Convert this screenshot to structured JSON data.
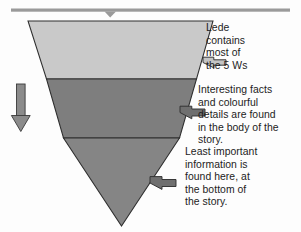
{
  "diagram": {
    "colors": {
      "top_band": "#c9c9c9",
      "middle_band": "#7e7e7e",
      "bottom_band": "#858585",
      "outline": "#2e2e2e",
      "rule": "#9a9a9a",
      "arrow_fill_light": "#c4c4c4",
      "arrow_fill_dark": "#6f6f6f",
      "arrow_outline": "#303030",
      "text": "#1c1c1c",
      "background": "#fdfdfd"
    },
    "top_rule": {
      "name": "top-horizontal-rule",
      "marker": "down-chevron"
    },
    "flow_arrow": {
      "name": "downward-flow-arrow",
      "direction": "down"
    },
    "bands": [
      {
        "id": "lede",
        "label": "Lede",
        "shade": "light"
      },
      {
        "id": "body",
        "label": "Body",
        "shade": "medium"
      },
      {
        "id": "tail",
        "label": "Tail",
        "shade": "medium-dark"
      }
    ],
    "callouts": [
      {
        "id": "lede",
        "text": "Lede\ncontains\nmost of\nthe 5 Ws",
        "arrow": "left-arrow-lede"
      },
      {
        "id": "body",
        "text": "Interesting facts\nand colourful\ndetails are found\nin the body of the\nstory.",
        "arrow": "left-arrow-body"
      },
      {
        "id": "tail",
        "text": "Least important\ninformation is\nfound here, at\nthe bottom of\nthe story.",
        "arrow": "left-arrow-tail"
      }
    ]
  }
}
